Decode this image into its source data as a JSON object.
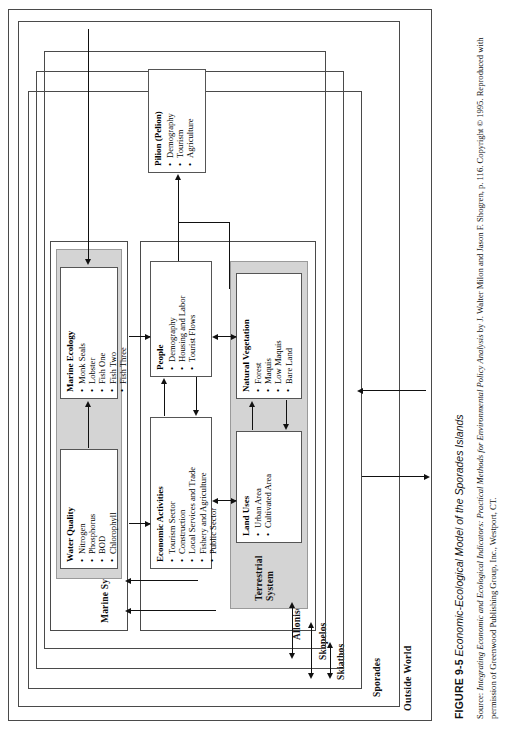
{
  "figure": {
    "caption_label": "FIGURE 9-5",
    "caption_title": "Economic-Ecological Model of the Sporades Islands",
    "source_prefix": "Source: ",
    "source_italic": "Integrating Economic and Ecological Indicators: Practical Methods for Environmental Policy Analysis",
    "source_rest": " by J. Walter Milon and Jason F. Shogren, p. 116. Copyright © 1995. Reproduced with permission of Greenwood Publishing Group, Inc., Westport, CT."
  },
  "frames": {
    "outside_world": "Outside World",
    "sporades": "Sporades",
    "skiathos": "Skiathos",
    "skopelos": "Skopelos",
    "allonisos": "Allonisos"
  },
  "systems": {
    "marine_system_label": "Marine System",
    "terrestrial_system_label": "Terrestrial\nSystem"
  },
  "boxes": {
    "water_quality": {
      "title": "Water Quality",
      "items": [
        "Nitrogen",
        "Phosphorus",
        "BOD",
        "Chlorophyll"
      ]
    },
    "marine_ecology": {
      "title": "Marine Ecology",
      "items": [
        "Monk Seals",
        "Lobster",
        "Fish One",
        "Fish Two",
        "Fish Three"
      ]
    },
    "economic_activities": {
      "title": "Economic Activities",
      "items": [
        "Tourism Sector",
        "Construction",
        "Local Services and Trade",
        "Fishery and Agriculture",
        "Public Sector"
      ]
    },
    "people": {
      "title": "People",
      "items": [
        "Demography",
        "Housing and Labor",
        "Tourist Flows"
      ]
    },
    "land_uses": {
      "title": "Land Uses",
      "items": [
        "Urban Area",
        "Cultivated Area"
      ]
    },
    "natural_vegetation": {
      "title": "Natural Vegetation",
      "items": [
        "Forest",
        "Maquis",
        "Low Maquis",
        "Bare Land"
      ]
    },
    "pilion": {
      "title": "Pilion (Pelion)",
      "items": [
        "Demography",
        "Tourism",
        "Agriculture"
      ]
    }
  },
  "colors": {
    "shade": "#d4d4d4",
    "line": "#4a4a4a",
    "arrow": "#111111",
    "page": "#ffffff"
  }
}
